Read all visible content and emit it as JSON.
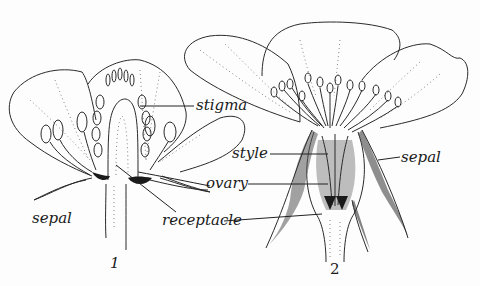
{
  "diagram": {
    "type": "botanical cross-section illustration",
    "figures": [
      {
        "number": "1",
        "labels": [
          "stigma",
          "sepal",
          "ovary",
          "receptacle"
        ]
      },
      {
        "number": "2",
        "labels": [
          "style",
          "sepal",
          "ovary",
          "receptacle"
        ]
      }
    ]
  },
  "labels": {
    "stigma": "stigma",
    "sepal_left": "sepal",
    "style": "style",
    "sepal_right": "sepal",
    "ovary": "ovary",
    "receptacle": "receptacle"
  },
  "figure_numbers": {
    "fig1": "1",
    "fig2": "2"
  },
  "colors": {
    "background": "#fdfdfd",
    "ink": "#2a2a2a"
  }
}
